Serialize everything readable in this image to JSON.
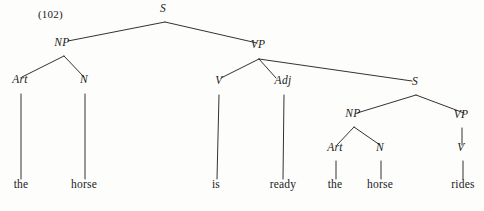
{
  "figure": {
    "example_number": "(102)",
    "sentence": "the horse is ready the horse rides",
    "ink_color": "#1b1b1b",
    "background_color": "#fdfdfc"
  },
  "nodes": [
    {
      "id": "S1",
      "label": "S",
      "kind": "nonterminal",
      "x": 163,
      "y": 14
    },
    {
      "id": "NP1",
      "label": "NP",
      "kind": "nonterminal",
      "x": 62,
      "y": 48
    },
    {
      "id": "VP1",
      "label": "VP",
      "kind": "nonterminal",
      "x": 258,
      "y": 50
    },
    {
      "id": "Art1",
      "label": "Art",
      "kind": "nonterminal",
      "x": 20,
      "y": 85
    },
    {
      "id": "N1",
      "label": "N",
      "kind": "nonterminal",
      "x": 84,
      "y": 85
    },
    {
      "id": "V1",
      "label": "V",
      "kind": "nonterminal",
      "x": 219,
      "y": 86
    },
    {
      "id": "Adj1",
      "label": "Adj",
      "kind": "nonterminal",
      "x": 283,
      "y": 86
    },
    {
      "id": "S2",
      "label": "S",
      "kind": "nonterminal",
      "x": 415,
      "y": 87
    },
    {
      "id": "NP2",
      "label": "NP",
      "kind": "nonterminal",
      "x": 353,
      "y": 119
    },
    {
      "id": "VP2",
      "label": "VP",
      "kind": "nonterminal",
      "x": 461,
      "y": 120
    },
    {
      "id": "Art2",
      "label": "Art",
      "kind": "nonterminal",
      "x": 335,
      "y": 153
    },
    {
      "id": "N2",
      "label": "N",
      "kind": "nonterminal",
      "x": 380,
      "y": 153
    },
    {
      "id": "V2",
      "label": "V",
      "kind": "nonterminal",
      "x": 461,
      "y": 153
    },
    {
      "id": "w-the-1",
      "label": "the",
      "kind": "terminal",
      "x": 21,
      "y": 190
    },
    {
      "id": "w-horse-1",
      "label": "horse",
      "kind": "terminal",
      "x": 84,
      "y": 190
    },
    {
      "id": "w-is",
      "label": "is",
      "kind": "terminal",
      "x": 216,
      "y": 190
    },
    {
      "id": "w-ready",
      "label": "ready",
      "kind": "terminal",
      "x": 283,
      "y": 190
    },
    {
      "id": "w-the-2",
      "label": "the",
      "kind": "terminal",
      "x": 335,
      "y": 190
    },
    {
      "id": "w-horse-2",
      "label": "horse",
      "kind": "terminal",
      "x": 380,
      "y": 190
    },
    {
      "id": "w-rides",
      "label": "rides",
      "kind": "terminal",
      "x": 463,
      "y": 190
    }
  ],
  "edges": [
    {
      "from": "S1",
      "to": "NP1",
      "x1": 165,
      "y1": 22,
      "x2": 68,
      "y2": 41
    },
    {
      "from": "S1",
      "to": "VP1",
      "x1": 165,
      "y1": 22,
      "x2": 257,
      "y2": 43
    },
    {
      "from": "NP1",
      "to": "Art1",
      "x1": 64,
      "y1": 56,
      "x2": 22,
      "y2": 77
    },
    {
      "from": "NP1",
      "to": "N1",
      "x1": 64,
      "y1": 56,
      "x2": 84,
      "y2": 77
    },
    {
      "from": "Art1",
      "to": "w-the-1",
      "x1": 21,
      "y1": 94,
      "x2": 21,
      "y2": 179
    },
    {
      "from": "N1",
      "to": "w-horse-1",
      "x1": 85,
      "y1": 94,
      "x2": 85,
      "y2": 179
    },
    {
      "from": "VP1",
      "to": "V1",
      "x1": 259,
      "y1": 59,
      "x2": 221,
      "y2": 78
    },
    {
      "from": "VP1",
      "to": "Adj1",
      "x1": 259,
      "y1": 59,
      "x2": 276,
      "y2": 78
    },
    {
      "from": "VP1",
      "to": "S2",
      "x1": 259,
      "y1": 59,
      "x2": 412,
      "y2": 81
    },
    {
      "from": "V1",
      "to": "w-is",
      "x1": 219,
      "y1": 95,
      "x2": 217,
      "y2": 179
    },
    {
      "from": "Adj1",
      "to": "w-ready",
      "x1": 284,
      "y1": 95,
      "x2": 283,
      "y2": 179
    },
    {
      "from": "S2",
      "to": "NP2",
      "x1": 416,
      "y1": 95,
      "x2": 357,
      "y2": 113
    },
    {
      "from": "S2",
      "to": "VP2",
      "x1": 416,
      "y1": 95,
      "x2": 464,
      "y2": 113
    },
    {
      "from": "NP2",
      "to": "Art2",
      "x1": 354,
      "y1": 127,
      "x2": 337,
      "y2": 145
    },
    {
      "from": "NP2",
      "to": "N2",
      "x1": 354,
      "y1": 127,
      "x2": 380,
      "y2": 145
    },
    {
      "from": "Art2",
      "to": "w-the-2",
      "x1": 336,
      "y1": 161,
      "x2": 336,
      "y2": 179
    },
    {
      "from": "N2",
      "to": "w-horse-2",
      "x1": 381,
      "y1": 161,
      "x2": 381,
      "y2": 179
    },
    {
      "from": "VP2",
      "to": "V2",
      "x1": 462,
      "y1": 128,
      "x2": 462,
      "y2": 145
    },
    {
      "from": "V2",
      "to": "w-rides",
      "x1": 463,
      "y1": 161,
      "x2": 463,
      "y2": 179
    }
  ]
}
